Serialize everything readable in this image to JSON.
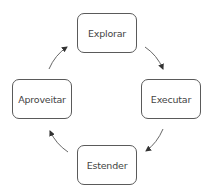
{
  "diagram": {
    "type": "cycle",
    "nodes": [
      {
        "id": "explorar",
        "label": "Explorar",
        "position": "top"
      },
      {
        "id": "executar",
        "label": "Executar",
        "position": "right"
      },
      {
        "id": "estender",
        "label": "Estender",
        "position": "bottom"
      },
      {
        "id": "aproveitar",
        "label": "Aproveitar",
        "position": "left"
      }
    ],
    "edges": [
      {
        "from": "explorar",
        "to": "executar",
        "direction": "clockwise"
      },
      {
        "from": "executar",
        "to": "estender",
        "direction": "clockwise"
      },
      {
        "from": "estender",
        "to": "aproveitar",
        "direction": "clockwise"
      },
      {
        "from": "aproveitar",
        "to": "explorar",
        "direction": "clockwise"
      }
    ],
    "colors": {
      "border": "#5a5a5a",
      "text": "#444444",
      "arrow": "#333333",
      "background": "#ffffff"
    }
  }
}
